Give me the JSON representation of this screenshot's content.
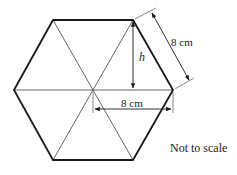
{
  "diagram": {
    "type": "regular-hexagon-with-dimensions",
    "labels": {
      "side_length": "8 cm",
      "radius_length": "8 cm",
      "height_label": "h",
      "note": "Not to scale"
    },
    "colors": {
      "outline": "#1a1a1a",
      "inner_lines": "#444444",
      "text": "#222222",
      "background": "#ffffff"
    }
  }
}
